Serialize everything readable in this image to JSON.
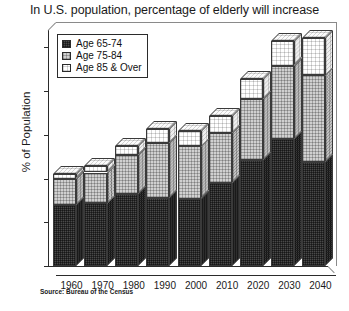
{
  "chart_data": {
    "type": "bar",
    "subtype": "stacked-3d-column",
    "title": "In U.S. population, percentage of elderly will increase",
    "xlabel": "",
    "ylabel": "% of Population",
    "ylim": [
      0,
      27
    ],
    "yticks": [
      0,
      5,
      10,
      15,
      20,
      25
    ],
    "ytick_labels": [
      "0",
      "5",
      "10",
      "15",
      "20",
      "25"
    ],
    "grid": false,
    "legend_position": "top-left",
    "categories": [
      "1960",
      "1970",
      "1980",
      "1990",
      "2000",
      "2010",
      "2020",
      "2030",
      "2040"
    ],
    "series": [
      {
        "name": "Age 65-74",
        "color": "#4a4a4a",
        "values": [
          7.0,
          7.2,
          8.2,
          7.8,
          7.7,
          9.5,
          12.1,
          14.5,
          11.9
        ]
      },
      {
        "name": "Age 75-84",
        "color": "#d0d0d0",
        "values": [
          3.0,
          3.5,
          4.5,
          6.3,
          6.0,
          5.7,
          7.0,
          8.4,
          9.9
        ]
      },
      {
        "name": "Age 85 & Over",
        "color": "#ffffff",
        "values": [
          0.5,
          0.7,
          1.0,
          1.6,
          1.8,
          2.0,
          2.3,
          2.8,
          4.3
        ]
      }
    ],
    "totals": [
      10.5,
      11.4,
      13.7,
      15.7,
      15.5,
      17.2,
      21.4,
      25.7,
      26.1
    ],
    "annotations": [
      "Source: Bureau of the Census"
    ]
  },
  "title": {
    "text": "In U.S. population, percentage of elderly will increase"
  },
  "axes": {
    "y_label": "% of Population",
    "y_ticks": [
      "25",
      "20",
      "15",
      "10",
      "5",
      "0"
    ],
    "x_ticks": [
      "1960",
      "1970",
      "1980",
      "1990",
      "2000",
      "2010",
      "2020",
      "2030",
      "2040"
    ]
  },
  "legend": {
    "items": [
      {
        "label": "Age 65-74",
        "fill": "dark"
      },
      {
        "label": "Age 75-84",
        "fill": "mid"
      },
      {
        "label": "Age 85 & Over",
        "fill": "light"
      }
    ]
  },
  "footer": {
    "source": "Source: Bureau of the Census"
  }
}
